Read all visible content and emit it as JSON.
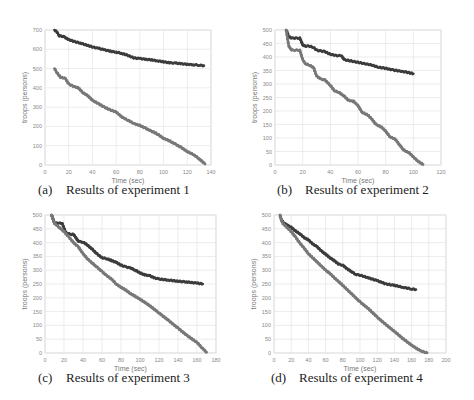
{
  "chart_data": [
    {
      "id": "a",
      "type": "scatter",
      "caption_tag": "(a)",
      "caption": "Results of experiment 1",
      "xlabel": "Time (sec)",
      "ylabel": "troops (persons)",
      "xlim": [
        0,
        140
      ],
      "ylim": [
        0,
        700
      ],
      "xticks": [
        0,
        20,
        40,
        60,
        80,
        100,
        120,
        140
      ],
      "yticks": [
        0,
        100,
        200,
        300,
        400,
        500,
        600,
        700
      ],
      "grid": true,
      "plot_box": {
        "x0": 45,
        "x1": 211,
        "y0": 165,
        "y1": 30
      },
      "series": [
        {
          "name": "upper",
          "color": "#3c3c3c",
          "x": [
            8,
            10,
            12,
            16,
            20,
            25,
            30,
            35,
            40,
            45,
            50,
            55,
            60,
            65,
            70,
            75,
            80,
            85,
            90,
            95,
            100,
            105,
            110,
            115,
            120,
            125,
            130,
            134
          ],
          "y": [
            700,
            690,
            670,
            665,
            650,
            640,
            632,
            622,
            612,
            605,
            597,
            590,
            585,
            578,
            568,
            555,
            552,
            548,
            545,
            540,
            535,
            530,
            528,
            525,
            522,
            520,
            518,
            515
          ]
        },
        {
          "name": "lower",
          "color": "#787878",
          "x": [
            8,
            10,
            13,
            17,
            20,
            23,
            28,
            32,
            36,
            40,
            45,
            50,
            55,
            60,
            65,
            70,
            75,
            80,
            85,
            90,
            95,
            100,
            105,
            110,
            115,
            120,
            125,
            130,
            135
          ],
          "y": [
            500,
            480,
            455,
            450,
            420,
            410,
            400,
            375,
            360,
            335,
            318,
            300,
            285,
            275,
            248,
            232,
            215,
            205,
            190,
            175,
            160,
            138,
            125,
            108,
            90,
            70,
            55,
            32,
            5
          ]
        }
      ]
    },
    {
      "id": "b",
      "type": "scatter",
      "caption_tag": "(b)",
      "caption": "Results of experiment 2",
      "xlabel": "Time (sec)",
      "ylabel": "troops (persons)",
      "xlim": [
        0,
        120
      ],
      "ylim": [
        0,
        500
      ],
      "xticks": [
        0,
        20,
        40,
        60,
        80,
        100,
        120
      ],
      "yticks": [
        0,
        50,
        100,
        150,
        200,
        250,
        300,
        350,
        400,
        450,
        500
      ],
      "grid": true,
      "plot_box": {
        "x0": 275,
        "x1": 441,
        "y0": 165,
        "y1": 30
      },
      "series": [
        {
          "name": "upper",
          "color": "#3c3c3c",
          "x": [
            8,
            9,
            10,
            12,
            15,
            18,
            20,
            22,
            25,
            28,
            30,
            33,
            36,
            40,
            45,
            48,
            50,
            55,
            60,
            65,
            70,
            75,
            80,
            85,
            90,
            95,
            100
          ],
          "y": [
            500,
            490,
            475,
            470,
            470,
            470,
            445,
            440,
            440,
            435,
            425,
            422,
            420,
            410,
            405,
            405,
            390,
            385,
            380,
            375,
            370,
            362,
            358,
            352,
            348,
            344,
            338
          ]
        },
        {
          "name": "lower",
          "color": "#787878",
          "x": [
            8,
            9,
            10,
            12,
            18,
            20,
            22,
            25,
            28,
            30,
            33,
            36,
            40,
            43,
            46,
            50,
            53,
            57,
            60,
            63,
            67,
            70,
            73,
            77,
            80,
            83,
            87,
            90,
            93,
            97,
            100,
            103,
            107
          ],
          "y": [
            500,
            470,
            440,
            425,
            425,
            390,
            375,
            370,
            360,
            330,
            318,
            315,
            295,
            275,
            270,
            255,
            240,
            235,
            220,
            195,
            185,
            170,
            150,
            140,
            125,
            105,
            95,
            75,
            55,
            45,
            30,
            15,
            2
          ]
        }
      ]
    },
    {
      "id": "c",
      "type": "scatter",
      "caption_tag": "(c)",
      "caption": "Results of experiment 3",
      "xlabel": "Time (sec)",
      "ylabel": "troops (persons)",
      "xlim": [
        0,
        180
      ],
      "ylim": [
        0,
        500
      ],
      "xticks": [
        0,
        20,
        40,
        60,
        80,
        100,
        120,
        140,
        160,
        180
      ],
      "yticks": [
        0,
        50,
        100,
        150,
        200,
        250,
        300,
        350,
        400,
        450,
        500
      ],
      "grid": true,
      "plot_box": {
        "x0": 45,
        "x1": 216,
        "y0": 353,
        "y1": 215
      },
      "series": [
        {
          "name": "upper",
          "color": "#3c3c3c",
          "x": [
            7,
            10,
            14,
            18,
            22,
            26,
            30,
            35,
            40,
            45,
            50,
            55,
            60,
            65,
            70,
            75,
            80,
            85,
            90,
            95,
            100,
            105,
            110,
            115,
            120,
            130,
            140,
            150,
            160,
            166
          ],
          "y": [
            500,
            470,
            470,
            470,
            435,
            430,
            430,
            405,
            402,
            390,
            375,
            358,
            345,
            342,
            335,
            328,
            318,
            312,
            308,
            300,
            290,
            283,
            280,
            272,
            268,
            264,
            260,
            257,
            253,
            250
          ]
        },
        {
          "name": "lower",
          "color": "#787878",
          "x": [
            7,
            10,
            15,
            20,
            25,
            30,
            35,
            40,
            45,
            50,
            55,
            60,
            65,
            70,
            75,
            80,
            85,
            90,
            95,
            100,
            110,
            120,
            130,
            140,
            150,
            160,
            165,
            170
          ],
          "y": [
            500,
            470,
            455,
            440,
            420,
            400,
            385,
            360,
            340,
            325,
            310,
            295,
            280,
            268,
            250,
            238,
            228,
            215,
            205,
            195,
            172,
            145,
            118,
            90,
            62,
            38,
            20,
            3
          ]
        }
      ]
    },
    {
      "id": "d",
      "type": "scatter",
      "caption_tag": "(d)",
      "caption": "Results of experiment 4",
      "xlabel": "Time (sec)",
      "ylabel": "troops (persons)",
      "xlim": [
        0,
        200
      ],
      "ylim": [
        0,
        500
      ],
      "xticks": [
        0,
        20,
        40,
        60,
        80,
        100,
        120,
        140,
        160,
        180,
        200
      ],
      "yticks": [
        0,
        50,
        100,
        150,
        200,
        250,
        300,
        350,
        400,
        450,
        500
      ],
      "grid": true,
      "plot_box": {
        "x0": 274,
        "x1": 446,
        "y0": 353,
        "y1": 215
      },
      "series": [
        {
          "name": "upper",
          "color": "#3c3c3c",
          "x": [
            7,
            9,
            12,
            16,
            20,
            25,
            30,
            35,
            40,
            45,
            50,
            55,
            60,
            65,
            70,
            75,
            80,
            85,
            90,
            95,
            100,
            110,
            120,
            130,
            140,
            150,
            160,
            165
          ],
          "y": [
            500,
            480,
            470,
            462,
            455,
            442,
            432,
            418,
            410,
            395,
            385,
            370,
            358,
            345,
            335,
            322,
            318,
            305,
            295,
            285,
            282,
            272,
            262,
            250,
            245,
            238,
            232,
            230
          ]
        },
        {
          "name": "lower",
          "color": "#787878",
          "x": [
            7,
            10,
            15,
            20,
            25,
            30,
            35,
            40,
            45,
            50,
            55,
            60,
            65,
            70,
            80,
            90,
            100,
            110,
            120,
            130,
            140,
            150,
            160,
            170,
            178
          ],
          "y": [
            500,
            470,
            455,
            440,
            420,
            398,
            380,
            360,
            345,
            330,
            315,
            300,
            288,
            273,
            245,
            215,
            185,
            160,
            130,
            103,
            78,
            52,
            28,
            8,
            0
          ]
        }
      ]
    }
  ]
}
